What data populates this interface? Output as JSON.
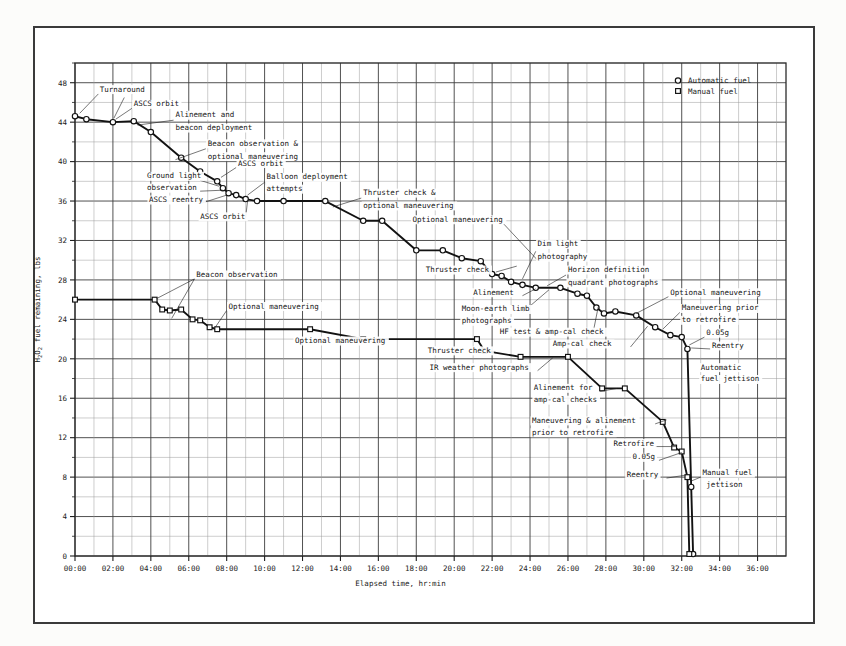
{
  "chart_data": {
    "type": "line",
    "title": "",
    "xlabel": "Elapsed time, hr:min",
    "ylabel": "H₂O₂ fuel remaining, lbs",
    "xlim": [
      0,
      37.5
    ],
    "ylim": [
      0,
      50
    ],
    "grid": true,
    "legend_position": "top-right",
    "x_tick_labels": [
      "00:00",
      "02:00",
      "04:00",
      "06:00",
      "08:00",
      "10:00",
      "12:00",
      "14:00",
      "16:00",
      "18:00",
      "20:00",
      "22:00",
      "24:00",
      "26:00",
      "28:00",
      "30:00",
      "32:00",
      "34:00",
      "36:00"
    ],
    "x_tick_values": [
      0,
      2,
      4,
      6,
      8,
      10,
      12,
      14,
      16,
      18,
      20,
      22,
      24,
      26,
      28,
      30,
      32,
      34,
      36
    ],
    "y_tick_labels": [
      "0",
      "4",
      "8",
      "12",
      "16",
      "20",
      "24",
      "28",
      "32",
      "36",
      "40",
      "44",
      "48"
    ],
    "y_tick_values": [
      0,
      4,
      8,
      12,
      16,
      20,
      24,
      28,
      32,
      36,
      40,
      44,
      48
    ],
    "y_minor_step": 2,
    "x_minor_step": 1,
    "series": [
      {
        "name": "Automatic fuel",
        "marker": "circle",
        "points": [
          [
            0.0,
            44.6
          ],
          [
            0.6,
            44.3
          ],
          [
            2.0,
            44.0
          ],
          [
            3.1,
            44.1
          ],
          [
            4.0,
            43.0
          ],
          [
            5.6,
            40.4
          ],
          [
            6.6,
            39.0
          ],
          [
            7.5,
            38.0
          ],
          [
            7.8,
            37.3
          ],
          [
            8.1,
            36.8
          ],
          [
            8.5,
            36.6
          ],
          [
            9.0,
            36.2
          ],
          [
            9.6,
            36.0
          ],
          [
            11.0,
            36.0
          ],
          [
            13.2,
            36.0
          ],
          [
            15.2,
            34.0
          ],
          [
            16.2,
            34.0
          ],
          [
            18.0,
            31.0
          ],
          [
            19.4,
            31.0
          ],
          [
            20.4,
            30.2
          ],
          [
            21.4,
            29.9
          ],
          [
            22.0,
            28.6
          ],
          [
            22.5,
            28.4
          ],
          [
            23.0,
            27.8
          ],
          [
            23.6,
            27.5
          ],
          [
            24.3,
            27.2
          ],
          [
            25.6,
            27.2
          ],
          [
            26.5,
            26.6
          ],
          [
            27.0,
            26.4
          ],
          [
            27.5,
            25.2
          ],
          [
            27.9,
            24.6
          ],
          [
            28.5,
            24.8
          ],
          [
            29.6,
            24.4
          ],
          [
            30.6,
            23.2
          ],
          [
            31.4,
            22.4
          ],
          [
            32.0,
            22.2
          ],
          [
            32.3,
            21.0
          ],
          [
            32.5,
            7.0
          ],
          [
            32.6,
            0.2
          ]
        ]
      },
      {
        "name": "Manual fuel",
        "marker": "square",
        "points": [
          [
            0.0,
            26.0
          ],
          [
            4.2,
            26.0
          ],
          [
            4.6,
            25.0
          ],
          [
            5.0,
            24.9
          ],
          [
            5.6,
            25.0
          ],
          [
            6.2,
            24.0
          ],
          [
            6.6,
            23.9
          ],
          [
            7.1,
            23.2
          ],
          [
            7.5,
            23.0
          ],
          [
            12.4,
            23.0
          ],
          [
            15.2,
            22.0
          ],
          [
            21.2,
            22.0
          ],
          [
            21.6,
            20.8
          ],
          [
            23.5,
            20.2
          ],
          [
            26.0,
            20.2
          ],
          [
            27.8,
            17.0
          ],
          [
            29.0,
            17.0
          ],
          [
            31.0,
            13.6
          ],
          [
            31.6,
            11.0
          ],
          [
            32.0,
            10.6
          ],
          [
            32.3,
            8.0
          ],
          [
            32.4,
            0.2
          ]
        ]
      }
    ],
    "annotations": [
      {
        "text": "Turnaround",
        "tx": 1.3,
        "ty": 47.1,
        "anchor": "start",
        "leaders": [
          [
            [
              1.25,
              46.9
            ],
            [
              0.25,
              44.9
            ]
          ],
          [
            [
              2.6,
              46.5
            ],
            [
              2.05,
              44.4
            ]
          ]
        ]
      },
      {
        "text": "ASCS orbit",
        "tx": 3.1,
        "ty": 45.6,
        "anchor": "start",
        "leaders": [
          [
            [
              3.0,
              45.4
            ],
            [
              2.15,
              44.3
            ]
          ]
        ]
      },
      {
        "text": "Alinement and",
        "tx": 5.3,
        "ty": 44.5,
        "anchor": "start",
        "leaders": [
          [
            [
              5.2,
              44.2
            ],
            [
              3.3,
              43.7
            ]
          ]
        ]
      },
      {
        "text": "beacon deployment",
        "tx": 5.3,
        "ty": 43.2,
        "anchor": "start",
        "leaders": []
      },
      {
        "text": "Beacon observation &",
        "tx": 7.0,
        "ty": 41.6,
        "anchor": "start",
        "leaders": [
          [
            [
              6.9,
              41.3
            ],
            [
              5.3,
              40.2
            ]
          ]
        ]
      },
      {
        "text": "optional maneuvering",
        "tx": 7.0,
        "ty": 40.3,
        "anchor": "start",
        "leaders": []
      },
      {
        "text": "ASCS orbit",
        "tx": 8.6,
        "ty": 39.6,
        "anchor": "start",
        "leaders": [
          [
            [
              8.5,
              39.4
            ],
            [
              7.7,
              38.4
            ]
          ]
        ]
      },
      {
        "text": "Ground light",
        "tx": 3.8,
        "ty": 38.3,
        "anchor": "start",
        "leaders": [
          [
            [
              6.6,
              38.1
            ],
            [
              7.6,
              37.5
            ]
          ]
        ]
      },
      {
        "text": "observation",
        "tx": 3.8,
        "ty": 37.1,
        "anchor": "start",
        "leaders": [
          [
            [
              6.6,
              37.0
            ],
            [
              7.8,
              37.1
            ]
          ]
        ]
      },
      {
        "text": "ASCS reentry",
        "tx": 3.9,
        "ty": 35.9,
        "anchor": "start",
        "leaders": [
          [
            [
              6.7,
              35.8
            ],
            [
              8.0,
              36.6
            ]
          ]
        ]
      },
      {
        "text": "Balloon deployment",
        "tx": 10.1,
        "ty": 38.2,
        "anchor": "start",
        "leaders": [
          [
            [
              10.0,
              37.9
            ],
            [
              9.1,
              36.6
            ]
          ]
        ]
      },
      {
        "text": "attempts",
        "tx": 10.1,
        "ty": 37.0,
        "anchor": "start",
        "leaders": []
      },
      {
        "text": "ASCS orbit",
        "tx": 6.6,
        "ty": 34.2,
        "anchor": "start",
        "leaders": [
          [
            [
              9.0,
              34.3
            ],
            [
              9.1,
              36.0
            ]
          ]
        ]
      },
      {
        "text": "Thruster check &",
        "tx": 15.2,
        "ty": 36.6,
        "anchor": "start",
        "leaders": [
          [
            [
              15.1,
              36.3
            ],
            [
              13.6,
              35.4
            ]
          ]
        ]
      },
      {
        "text": "optional maneuvering",
        "tx": 15.2,
        "ty": 35.3,
        "anchor": "start",
        "leaders": []
      },
      {
        "text": "Optional maneuvering",
        "tx": 17.8,
        "ty": 33.9,
        "anchor": "start",
        "leaders": [
          [
            [
              22.6,
              33.7
            ],
            [
              24.4,
              30.0
            ]
          ]
        ]
      },
      {
        "text": "Thruster check",
        "tx": 18.5,
        "ty": 28.8,
        "anchor": "start",
        "leaders": [
          [
            [
              22.2,
              28.8
            ],
            [
              23.3,
              29.4
            ]
          ]
        ]
      },
      {
        "text": "Dim light",
        "tx": 24.4,
        "ty": 31.4,
        "anchor": "start",
        "leaders": [
          [
            [
              24.3,
              30.9
            ],
            [
              23.6,
              28.1
            ]
          ]
        ]
      },
      {
        "text": "photography",
        "tx": 24.4,
        "ty": 30.1,
        "anchor": "start",
        "leaders": []
      },
      {
        "text": "Horizon definition",
        "tx": 26.0,
        "ty": 28.8,
        "anchor": "start",
        "leaders": [
          [
            [
              25.9,
              28.5
            ],
            [
              24.9,
              27.4
            ]
          ]
        ]
      },
      {
        "text": "quadrant photographs",
        "tx": 26.0,
        "ty": 27.5,
        "anchor": "start",
        "leaders": []
      },
      {
        "text": "Alinement",
        "tx": 21.0,
        "ty": 26.5,
        "anchor": "start",
        "leaders": [
          [
            [
              23.6,
              26.4
            ],
            [
              24.3,
              27.1
            ]
          ]
        ]
      },
      {
        "text": "Moon-earth limb",
        "tx": 20.4,
        "ty": 24.8,
        "anchor": "start",
        "leaders": [
          [
            [
              23.6,
              24.7
            ],
            [
              25.0,
              27.0
            ]
          ]
        ]
      },
      {
        "text": "photographs",
        "tx": 20.4,
        "ty": 23.6,
        "anchor": "start",
        "leaders": []
      },
      {
        "text": "Optional maneuvering",
        "tx": 31.4,
        "ty": 26.5,
        "anchor": "start",
        "leaders": [
          [
            [
              31.3,
              26.3
            ],
            [
              29.6,
              24.6
            ]
          ]
        ]
      },
      {
        "text": "Maneuvering prior",
        "tx": 32.0,
        "ty": 24.9,
        "anchor": "start",
        "leaders": [
          [
            [
              31.9,
              24.7
            ],
            [
              31.0,
              23.0
            ]
          ]
        ]
      },
      {
        "text": "to retrofire",
        "tx": 32.0,
        "ty": 23.7,
        "anchor": "start",
        "leaders": []
      },
      {
        "text": "0.05g",
        "tx": 33.3,
        "ty": 22.4,
        "anchor": "start",
        "leaders": [
          [
            [
              33.2,
              22.2
            ],
            [
              32.4,
              21.4
            ]
          ]
        ]
      },
      {
        "text": "Reentry",
        "tx": 33.6,
        "ty": 21.1,
        "anchor": "start",
        "leaders": [
          [
            [
              33.5,
              21.0
            ],
            [
              32.5,
              21.1
            ]
          ]
        ]
      },
      {
        "text": "Automatic",
        "tx": 33.0,
        "ty": 18.9,
        "anchor": "start",
        "leaders": []
      },
      {
        "text": "fuel jettison",
        "tx": 33.0,
        "ty": 17.7,
        "anchor": "start",
        "leaders": []
      },
      {
        "text": "Beacon observation",
        "tx": 6.4,
        "ty": 28.3,
        "anchor": "start",
        "leaders": [
          [
            [
              6.3,
              28.1
            ],
            [
              4.3,
              26.1
            ]
          ],
          [
            [
              6.3,
              28.1
            ],
            [
              5.1,
              24.1
            ]
          ]
        ]
      },
      {
        "text": "Optional maneuvering",
        "tx": 8.1,
        "ty": 25.1,
        "anchor": "start",
        "leaders": [
          [
            [
              8.0,
              24.9
            ],
            [
              7.4,
              23.2
            ]
          ]
        ]
      },
      {
        "text": "Optional maneuvering",
        "tx": 11.6,
        "ty": 21.6,
        "anchor": "start",
        "leaders": [
          [
            [
              15.9,
              21.5
            ],
            [
              15.4,
              22.0
            ]
          ]
        ]
      },
      {
        "text": "Thruster check",
        "tx": 18.6,
        "ty": 20.6,
        "anchor": "start",
        "leaders": [
          [
            [
              22.2,
              20.6
            ],
            [
              21.5,
              21.0
            ]
          ]
        ]
      },
      {
        "text": "IR weather photographs",
        "tx": 18.7,
        "ty": 18.9,
        "anchor": "start",
        "leaders": [
          [
            [
              24.4,
              18.8
            ],
            [
              25.2,
              20.1
            ]
          ]
        ]
      },
      {
        "text": "HF test & amp-cal check",
        "tx": 22.4,
        "ty": 22.5,
        "anchor": "start",
        "leaders": [
          [
            [
              27.3,
              22.4
            ],
            [
              27.6,
              25.3
            ]
          ]
        ]
      },
      {
        "text": "Amp-cal check",
        "tx": 25.2,
        "ty": 21.3,
        "anchor": "start",
        "leaders": [
          [
            [
              29.3,
              21.2
            ],
            [
              30.2,
              23.3
            ]
          ]
        ]
      },
      {
        "text": "Alinement for",
        "tx": 24.2,
        "ty": 16.8,
        "anchor": "start",
        "leaders": [
          [
            [
              27.7,
              16.7
            ],
            [
              28.6,
              17.0
            ]
          ]
        ]
      },
      {
        "text": "amp-cal checks",
        "tx": 24.2,
        "ty": 15.6,
        "anchor": "start",
        "leaders": []
      },
      {
        "text": "Maneuvering & alinement",
        "tx": 24.1,
        "ty": 13.5,
        "anchor": "start",
        "leaders": [
          [
            [
              30.6,
              13.4
            ],
            [
              31.2,
              13.8
            ]
          ]
        ]
      },
      {
        "text": "prior to retrofire",
        "tx": 24.1,
        "ty": 12.3,
        "anchor": "start",
        "leaders": []
      },
      {
        "text": "Retrofire",
        "tx": 28.4,
        "ty": 11.2,
        "anchor": "start",
        "leaders": [
          [
            [
              30.6,
              11.1
            ],
            [
              31.7,
              11.1
            ]
          ]
        ]
      },
      {
        "text": "0.05g",
        "tx": 29.4,
        "ty": 9.8,
        "anchor": "start",
        "leaders": [
          [
            [
              30.8,
              9.7
            ],
            [
              32.0,
              10.5
            ]
          ]
        ]
      },
      {
        "text": "Reentry",
        "tx": 29.1,
        "ty": 8.0,
        "anchor": "start",
        "leaders": [
          [
            [
              31.2,
              7.9
            ],
            [
              32.2,
              8.2
            ]
          ]
        ]
      },
      {
        "text": "Manual fuel",
        "tx": 33.1,
        "ty": 8.2,
        "anchor": "start",
        "leaders": [
          [
            [
              33.0,
              8.0
            ],
            [
              32.5,
              7.6
            ]
          ]
        ]
      },
      {
        "text": "jettison",
        "tx": 33.3,
        "ty": 7.0,
        "anchor": "start",
        "leaders": []
      }
    ],
    "legend": [
      {
        "label": "Automatic fuel",
        "marker": "circle"
      },
      {
        "label": "Manual fuel",
        "marker": "square"
      }
    ]
  }
}
